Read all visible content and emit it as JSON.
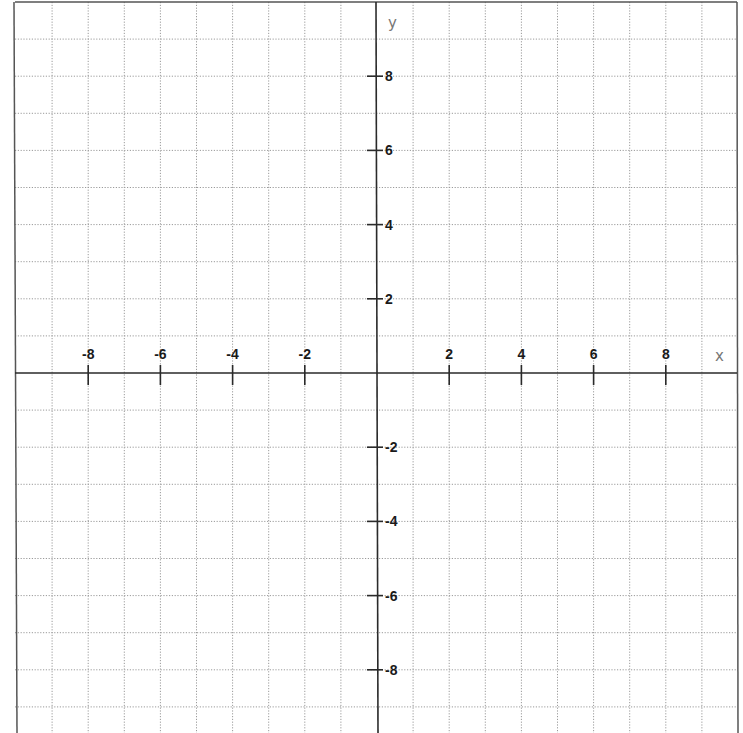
{
  "chart_data": {
    "type": "scatter",
    "title": "",
    "xlabel": "x",
    "ylabel": "y",
    "xlim": [
      -10,
      10
    ],
    "ylim": [
      -9,
      9.5
    ],
    "grid": true,
    "grid_step": 1,
    "x_ticks": [
      -8,
      -6,
      -4,
      -2,
      2,
      4,
      6,
      8
    ],
    "x_tick_labels": [
      "-8",
      "-6",
      "-4",
      "-2",
      "2",
      "4",
      "6",
      "8"
    ],
    "y_ticks": [
      8,
      6,
      4,
      2,
      -2,
      -4,
      -6,
      -8
    ],
    "y_tick_labels": [
      "8",
      "6",
      "4",
      "2",
      "-2",
      "-4",
      "-6",
      "-8"
    ],
    "series": [],
    "legend": null
  },
  "layout": {
    "origin_px": [
      377,
      373
    ],
    "unit_px_x": 36.1,
    "unit_px_y": 37.1,
    "frame": {
      "left": 15,
      "top": 2,
      "right": 737
    },
    "colors": {
      "axis": "#2a2a2a",
      "grid": "#9a9a9a",
      "frame": "#555555",
      "tick_label": "#1a1a1a",
      "axis_name": "#777777"
    }
  },
  "labels": {
    "x_axis_name": "x",
    "y_axis_name": "y"
  }
}
